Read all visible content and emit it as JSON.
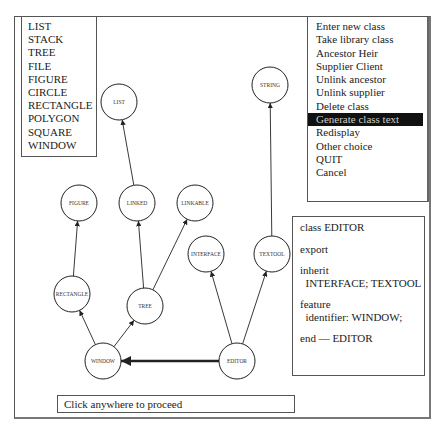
{
  "class_list": {
    "items": [
      "LIST",
      "STACK",
      "TREE",
      "FILE",
      "FIGURE",
      "CIRCLE",
      "RECTANGLE",
      "POLYGON",
      "SQUARE",
      "WINDOW"
    ]
  },
  "menu": {
    "items": [
      {
        "label": "Enter new class",
        "selected": false
      },
      {
        "label": "Take library class",
        "selected": false
      },
      {
        "label": "Ancestor Heir",
        "selected": false
      },
      {
        "label": "Supplier Client",
        "selected": false
      },
      {
        "label": "Unlink ancestor",
        "selected": false
      },
      {
        "label": "Unlink supplier",
        "selected": false
      },
      {
        "label": "Delete class",
        "selected": false
      },
      {
        "label": "Generate class text",
        "selected": true
      },
      {
        "label": "Redisplay",
        "selected": false
      },
      {
        "label": "Other choice",
        "selected": false
      },
      {
        "label": "QUIT",
        "selected": false
      },
      {
        "label": "Cancel",
        "selected": false
      }
    ]
  },
  "class_text": {
    "lines": [
      "class EDITOR",
      "",
      "export",
      "",
      "inherit",
      "  INTERFACE; TEXTOOL",
      "",
      "feature",
      "  identifier: WINDOW;",
      "",
      "end — EDITOR"
    ]
  },
  "status": {
    "message": "Click anywhere to proceed"
  },
  "graph": {
    "node_radius": 18,
    "nodes": [
      {
        "id": "LIST",
        "label": "LIST",
        "x": 119,
        "y": 102
      },
      {
        "id": "STRING",
        "label": "STRING",
        "x": 270,
        "y": 85
      },
      {
        "id": "FIGURE",
        "label": "FIGURE",
        "x": 79,
        "y": 203
      },
      {
        "id": "LINKED",
        "label": "LINKED",
        "x": 137,
        "y": 203
      },
      {
        "id": "LINKABLE",
        "label": "LINKABLE",
        "x": 195,
        "y": 203
      },
      {
        "id": "INTERFACE",
        "label": "INTERFACE",
        "x": 206,
        "y": 254
      },
      {
        "id": "TEXTOOL",
        "label": "TEXTOOL",
        "x": 272,
        "y": 254
      },
      {
        "id": "RECTANGLE",
        "label": "RECTANGLE",
        "x": 72,
        "y": 294
      },
      {
        "id": "TREE",
        "label": "TREE",
        "x": 145,
        "y": 306
      },
      {
        "id": "WINDOW",
        "label": "WINDOW",
        "x": 103,
        "y": 361
      },
      {
        "id": "EDITOR",
        "label": "EDITOR",
        "x": 237,
        "y": 361
      }
    ],
    "edges": [
      {
        "from": "LINKED",
        "to": "LIST",
        "kind": "inherit"
      },
      {
        "from": "TEXTOOL",
        "to": "STRING",
        "kind": "inherit"
      },
      {
        "from": "RECTANGLE",
        "to": "FIGURE",
        "kind": "inherit"
      },
      {
        "from": "TREE",
        "to": "LINKED",
        "kind": "inherit"
      },
      {
        "from": "TREE",
        "to": "LINKABLE",
        "kind": "inherit"
      },
      {
        "from": "WINDOW",
        "to": "RECTANGLE",
        "kind": "inherit"
      },
      {
        "from": "WINDOW",
        "to": "TREE",
        "kind": "inherit"
      },
      {
        "from": "EDITOR",
        "to": "INTERFACE",
        "kind": "inherit"
      },
      {
        "from": "EDITOR",
        "to": "TEXTOOL",
        "kind": "inherit"
      },
      {
        "from": "EDITOR",
        "to": "WINDOW",
        "kind": "client"
      }
    ]
  }
}
